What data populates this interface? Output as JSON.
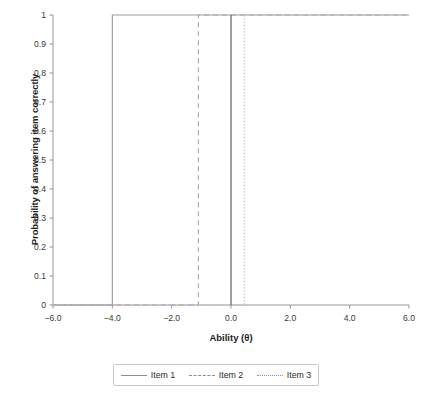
{
  "chart_data": {
    "type": "line",
    "title": "",
    "xlabel": "Ability (θ)",
    "ylabel": "Probability of answering item correctly",
    "xlim": [
      -6.0,
      6.0
    ],
    "ylim": [
      0,
      1
    ],
    "grid": false,
    "legend_position": "below-center",
    "xticks": [
      "−6.0",
      "−4.0",
      "−2.0",
      "0.0",
      "2.0",
      "4.0",
      "6.0"
    ],
    "xtick_values": [
      -6.0,
      -4.0,
      -2.0,
      0.0,
      2.0,
      4.0,
      6.0
    ],
    "yticks": [
      "0",
      "0.1",
      "0.2",
      "0.3",
      "0.4",
      "0.5",
      "0.6",
      "0.7",
      "0.8",
      "0.9",
      "1"
    ],
    "ytick_values": [
      0,
      0.1,
      0.2,
      0.3,
      0.4,
      0.5,
      0.6,
      0.7,
      0.8,
      0.9,
      1.0
    ],
    "series": [
      {
        "name": "Item 1",
        "linestyle": "solid",
        "color": "#9a9a9a",
        "threshold": -4.0,
        "x": [
          -6.0,
          -4.0,
          -4.0,
          6.0
        ],
        "values": [
          0,
          0,
          1,
          1
        ]
      },
      {
        "name": "Item 2",
        "linestyle": "dashed",
        "color": "#a6a6a6",
        "threshold": -1.1,
        "x": [
          -6.0,
          -1.1,
          -1.1,
          6.0
        ],
        "values": [
          0,
          0,
          1,
          1
        ]
      },
      {
        "name": "Item 3",
        "linestyle": "dotted",
        "color": "#bdbdbd",
        "threshold": 0.45,
        "x": [
          -6.0,
          0.45,
          0.45,
          6.0
        ],
        "values": [
          0,
          0,
          1,
          1
        ]
      }
    ],
    "annotations": [
      {
        "name": "theta-zero-marker",
        "linestyle": "solid",
        "color": "#555555",
        "x": 0.0,
        "y_from": 0,
        "y_to": 1
      }
    ]
  },
  "legend": {
    "entries": [
      {
        "label": "Item 1",
        "style": "solid"
      },
      {
        "label": "Item 2",
        "style": "dashed"
      },
      {
        "label": "Item 3",
        "style": "dotted"
      }
    ]
  },
  "colors": {
    "axis": "#8a8a8a",
    "tick_text": "#3a3a3a",
    "title_text": "#1e1e1e",
    "legend_border": "#c9c9c9",
    "background": "#ffffff"
  }
}
